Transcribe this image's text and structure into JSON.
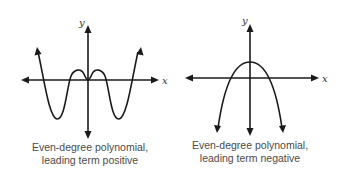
{
  "diagrams": [
    {
      "id": "left",
      "x_axis_label": "x",
      "y_axis_label": "y",
      "caption_line1": "Even-degree polynomial,",
      "caption_line2": "leading term positive",
      "curve_type": "quartic",
      "end_behavior": "both ends up"
    },
    {
      "id": "right",
      "x_axis_label": "x",
      "y_axis_label": "y",
      "caption_line1": "Even-degree polynomial,",
      "caption_line2": "leading term negative",
      "curve_type": "parabola",
      "end_behavior": "both ends down"
    }
  ],
  "colors": {
    "ink": "#1a1a1a",
    "caption": "#4a4a4a",
    "background": "#ffffff"
  }
}
